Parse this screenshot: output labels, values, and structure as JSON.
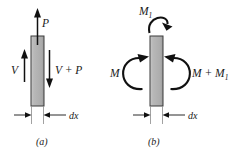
{
  "figure": {
    "background_color": "#ffffff",
    "ink_color": "#1a1a1a",
    "bar_fill_color": "#b3b3b3",
    "bar_edge_color": "#3b3b3b"
  },
  "panels": [
    {
      "id": "a",
      "caption": "(a)",
      "kind": "forces",
      "bar": {
        "x": 31,
        "y": 36,
        "width": 13,
        "height": 70
      },
      "labels": {
        "top_force": "P",
        "left_force": "V",
        "right_force": "V + P",
        "dimension": "dx"
      },
      "arrows": [
        {
          "name": "top-force-arrow",
          "label": "P",
          "direction": "up",
          "x": 37,
          "from_y": 44,
          "to_y": 11
        },
        {
          "name": "left-force-arrow",
          "label": "V",
          "direction": "up",
          "x": 24,
          "from_y": 82,
          "to_y": 51
        },
        {
          "name": "right-force-arrow",
          "label": "V + P",
          "direction": "down",
          "x": 49,
          "from_y": 50,
          "to_y": 88
        }
      ]
    },
    {
      "id": "b",
      "caption": "(b)",
      "kind": "moments",
      "bar": {
        "x": 150,
        "y": 36,
        "width": 13,
        "height": 70
      },
      "labels": {
        "top_moment": "M",
        "top_moment_sub": "1",
        "left_moment": "M",
        "right_moment": "M + M",
        "right_moment_sub": "1",
        "dimension": "dx"
      },
      "arrows": [
        {
          "name": "top-moment-arc",
          "label": "M1",
          "sense": "clockwise",
          "position": "above-bar"
        },
        {
          "name": "left-moment-arc",
          "label": "M",
          "sense": "clockwise",
          "position": "left-of-bar"
        },
        {
          "name": "right-moment-arc",
          "label": "M + M1",
          "sense": "counterclockwise",
          "position": "right-of-bar"
        }
      ]
    }
  ],
  "dimensions": [
    {
      "panel": "a",
      "label": "dx",
      "left_tick_x": 31,
      "right_tick_x": 44,
      "y": 115
    },
    {
      "panel": "b",
      "label": "dx",
      "left_tick_x": 150,
      "right_tick_x": 163,
      "y": 115
    }
  ]
}
